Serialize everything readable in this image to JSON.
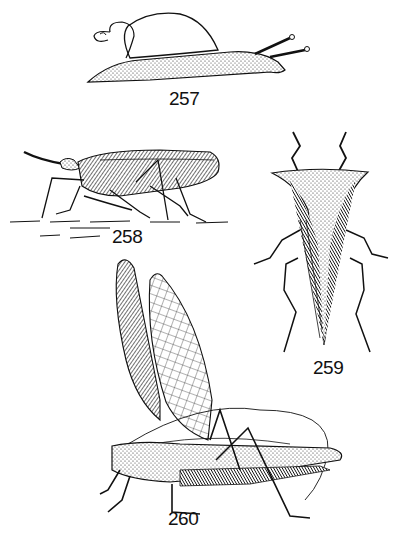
{
  "plate": {
    "background": "#ffffff",
    "ink": "#111111",
    "figures": [
      {
        "id": "257",
        "label": "257",
        "subject": "snail (side view)"
      },
      {
        "id": "258",
        "label": "258",
        "subject": "long-snouted hopper insect (side view)"
      },
      {
        "id": "259",
        "label": "259",
        "subject": "horned treehopper (dorsal view)"
      },
      {
        "id": "260",
        "label": "260",
        "subject": "katydid with wings raised (side view)"
      }
    ]
  }
}
